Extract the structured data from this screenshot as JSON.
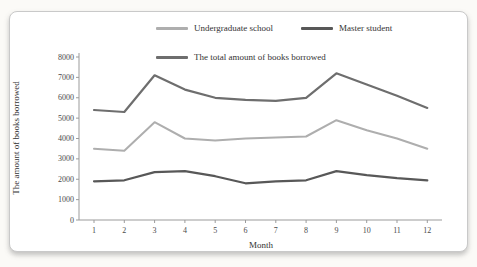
{
  "chart_data": {
    "type": "line",
    "title": "",
    "xlabel": "Month",
    "ylabel": "The amount of books borrowed",
    "x": [
      1,
      2,
      3,
      4,
      5,
      6,
      7,
      8,
      9,
      10,
      11,
      12
    ],
    "ylim": [
      0,
      8000
    ],
    "yticks": [
      0,
      1000,
      2000,
      3000,
      4000,
      5000,
      6000,
      7000,
      8000
    ],
    "grid": false,
    "legend_position": "top",
    "axis_color": "#9b9b9b",
    "series": [
      {
        "name": "Undergraduate school",
        "color": "#aeaeae",
        "values": [
          3500,
          3400,
          4800,
          4000,
          3900,
          4000,
          4050,
          4100,
          4900,
          4400,
          4000,
          3500
        ]
      },
      {
        "name": "Master student",
        "color": "#585858",
        "values": [
          1900,
          1950,
          2350,
          2400,
          2150,
          1800,
          1900,
          1950,
          2400,
          2200,
          2050,
          1950
        ]
      },
      {
        "name": "The total amount of books borrowed",
        "color": "#6e6e6e",
        "values": [
          5400,
          5300,
          7100,
          6400,
          6000,
          5900,
          5850,
          6000,
          7200,
          6650,
          6100,
          5500
        ]
      }
    ]
  }
}
